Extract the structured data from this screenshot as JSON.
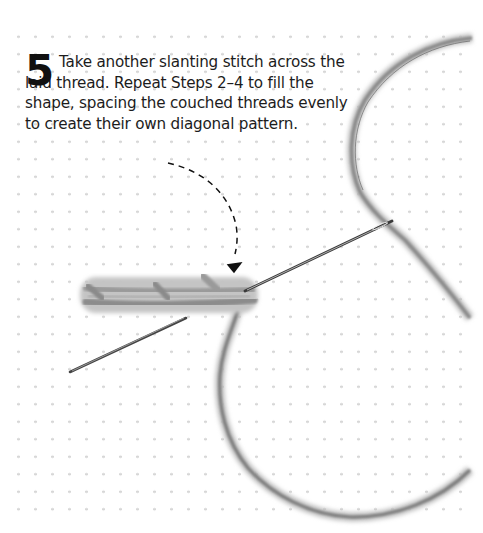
{
  "step": {
    "number": "5",
    "text": "Take another slanting stitch across the laid thread. Repeat Steps 2–4 to fill the shape, spacing the couched threads evenly to create their own diagonal pattern."
  },
  "illustration": {
    "subject": "couching-stitch-embroidery",
    "elements": [
      "dotted-fabric-grid",
      "laid-thread",
      "couching-stitches",
      "needle",
      "working-thread-loop",
      "dashed-pointer-arrow"
    ],
    "colors": {
      "thread": "#9a9a9a",
      "thread_dark": "#6e6e6e",
      "needle": "#3a3a3a",
      "dots": "#d2d2d2",
      "arrow": "#111111",
      "text": "#1c1c1c"
    }
  }
}
